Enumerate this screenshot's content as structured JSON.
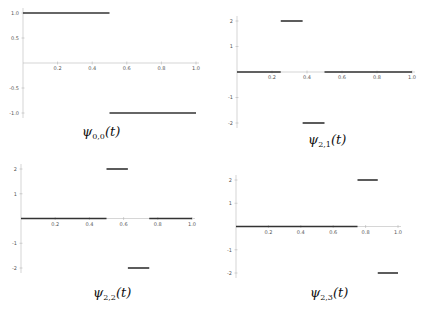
{
  "chart_data": [
    {
      "type": "line",
      "title": "ψ_{0,0}(t)",
      "caption": {
        "fn": "ψ",
        "sub": "0,0",
        "arg": "(t)"
      },
      "xlim": [
        0,
        1
      ],
      "ylim": [
        -1,
        1
      ],
      "xticks": [
        "0.2",
        "0.4",
        "0.6",
        "0.8",
        "1.0"
      ],
      "yticks": [
        "1.0",
        "0.5",
        "-0.5",
        "-1.0"
      ],
      "segments": [
        {
          "x": [
            0,
            0.5
          ],
          "y": 1
        },
        {
          "x": [
            0.5,
            1.0
          ],
          "y": -1
        }
      ]
    },
    {
      "type": "line",
      "title": "ψ_{2,1}(t)",
      "caption": {
        "fn": "ψ",
        "sub": "2,1",
        "arg": "(t)"
      },
      "xlim": [
        0,
        1
      ],
      "ylim": [
        -2,
        2
      ],
      "xticks": [
        "0.2",
        "0.4",
        "0.6",
        "0.8",
        "1.0"
      ],
      "yticks": [
        "2",
        "1",
        "-1",
        "-2"
      ],
      "segments": [
        {
          "x": [
            0,
            0.25
          ],
          "y": 0
        },
        {
          "x": [
            0.25,
            0.375
          ],
          "y": 2
        },
        {
          "x": [
            0.375,
            0.5
          ],
          "y": -2
        },
        {
          "x": [
            0.5,
            1.0
          ],
          "y": 0
        }
      ]
    },
    {
      "type": "line",
      "title": "ψ_{2,2}(t)",
      "caption": {
        "fn": "ψ",
        "sub": "2,2",
        "arg": "(t)"
      },
      "xlim": [
        0,
        1
      ],
      "ylim": [
        -2,
        2
      ],
      "xticks": [
        "0.2",
        "0.4",
        "0.6",
        "0.8",
        "1.0"
      ],
      "yticks": [
        "2",
        "1",
        "-1",
        "-2"
      ],
      "segments": [
        {
          "x": [
            0,
            0.5
          ],
          "y": 0
        },
        {
          "x": [
            0.5,
            0.625
          ],
          "y": 2
        },
        {
          "x": [
            0.625,
            0.75
          ],
          "y": -2
        },
        {
          "x": [
            0.75,
            1.0
          ],
          "y": 0
        }
      ]
    },
    {
      "type": "line",
      "title": "ψ_{2,3}(t)",
      "caption": {
        "fn": "ψ",
        "sub": "2,3",
        "arg": "(t)"
      },
      "xlim": [
        0,
        1
      ],
      "ylim": [
        -2,
        2
      ],
      "xticks": [
        "0.2",
        "0.4",
        "0.6",
        "0.8",
        "1.0"
      ],
      "yticks": [
        "2",
        "1",
        "-1",
        "-2"
      ],
      "segments": [
        {
          "x": [
            0,
            0.75
          ],
          "y": 0
        },
        {
          "x": [
            0.75,
            0.875
          ],
          "y": 2
        },
        {
          "x": [
            0.875,
            1.0
          ],
          "y": -2
        }
      ]
    }
  ],
  "layout": [
    {
      "x0": 23,
      "x1": 196,
      "yTop": 13,
      "yBottom": 113,
      "ymax": 1,
      "ymin": -1,
      "caption_left": 82,
      "caption_top": 124
    },
    {
      "x0": 237,
      "x1": 412,
      "yTop": 21,
      "yBottom": 123,
      "ymax": 2,
      "ymin": -2,
      "caption_left": 308,
      "caption_top": 132
    },
    {
      "x0": 21,
      "x1": 192,
      "yTop": 169,
      "yBottom": 268,
      "ymax": 2,
      "ymin": -2,
      "caption_left": 93,
      "caption_top": 285
    },
    {
      "x0": 236,
      "x1": 398,
      "yTop": 180,
      "yBottom": 273,
      "ymax": 2,
      "ymin": -2,
      "caption_left": 310,
      "caption_top": 285
    }
  ]
}
